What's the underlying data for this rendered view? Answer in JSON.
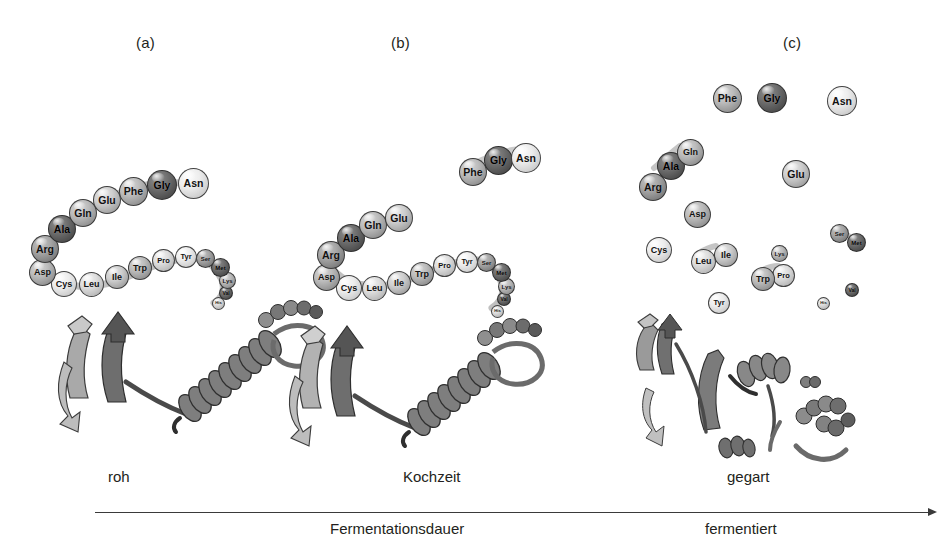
{
  "figure": {
    "type": "scientific-diagram",
    "background_color": "#ffffff"
  },
  "panels": [
    {
      "id": "a",
      "label": "(a)",
      "x": 143,
      "y": 36,
      "stage_caption": "roh"
    },
    {
      "id": "b",
      "label": "(b)",
      "x": 398,
      "y": 36,
      "stage_caption": "Kochzeit"
    },
    {
      "id": "c",
      "label": "(c)",
      "x": 790,
      "y": 36,
      "stage_caption": "gegart"
    }
  ],
  "axis": {
    "line": {
      "x1": 95,
      "x2": 930,
      "y": 512
    },
    "top_labels": [
      {
        "text": "roh",
        "x": 116,
        "y": 477
      },
      {
        "text": "Kochzeit",
        "x": 438,
        "y": 477
      },
      {
        "text": "gegart",
        "x": 756,
        "y": 477
      }
    ],
    "bottom_labels": [
      {
        "text": "Fermentationsdauer",
        "x": 396,
        "y": 527
      },
      {
        "text": "fermentiert",
        "x": 743,
        "y": 527
      }
    ]
  },
  "amino_acid_sequence": [
    "Asp",
    "Arg",
    "Ala",
    "Gln",
    "Glu",
    "Phe",
    "Gly",
    "Asn",
    "Cys",
    "Leu",
    "Ile",
    "Trp",
    "Pro",
    "Tyr",
    "Ser",
    "Met",
    "Lys",
    "Val",
    "His"
  ],
  "panel_a": {
    "description": "Intact folded protein: continuous polypeptide chain with alpha-helix and beta-sheet",
    "spheres": [
      {
        "label": "Asn",
        "x": 178,
        "y": 168,
        "d": 31,
        "tone": "t1"
      },
      {
        "label": "Gly",
        "x": 147,
        "y": 170,
        "d": 30,
        "tone": "t7"
      },
      {
        "label": "Phe",
        "x": 119,
        "y": 177,
        "d": 29,
        "tone": "t4"
      },
      {
        "label": "Glu",
        "x": 93,
        "y": 186,
        "d": 28,
        "tone": "t3"
      },
      {
        "label": "Gln",
        "x": 69,
        "y": 199,
        "d": 28,
        "tone": "t4"
      },
      {
        "label": "Ala",
        "x": 48,
        "y": 215,
        "d": 28,
        "tone": "t7"
      },
      {
        "label": "Arg",
        "x": 31,
        "y": 235,
        "d": 28,
        "tone": "t5"
      },
      {
        "label": "Asp",
        "x": 29,
        "y": 259,
        "d": 27,
        "tone": "t4"
      },
      {
        "label": "Cys",
        "x": 51,
        "y": 271,
        "d": 26,
        "tone": "t1"
      },
      {
        "label": "Leu",
        "x": 79,
        "y": 272,
        "d": 25,
        "tone": "t2"
      },
      {
        "label": "Ile",
        "x": 105,
        "y": 265,
        "d": 24,
        "tone": "t3"
      },
      {
        "label": "Trp",
        "x": 128,
        "y": 256,
        "d": 24,
        "tone": "t4"
      },
      {
        "label": "Pro",
        "x": 152,
        "y": 249,
        "d": 23,
        "tone": "t2"
      },
      {
        "label": "Tyr",
        "x": 175,
        "y": 246,
        "d": 22,
        "tone": "t1"
      },
      {
        "label": "Ser",
        "x": 196,
        "y": 249,
        "d": 19,
        "tone": "t5"
      },
      {
        "label": "Met",
        "x": 211,
        "y": 258,
        "d": 19,
        "tone": "t7"
      },
      {
        "label": "Lys",
        "x": 219,
        "y": 272,
        "d": 17,
        "tone": "t4"
      },
      {
        "label": "Val",
        "x": 219,
        "y": 286,
        "d": 14,
        "tone": "t7"
      },
      {
        "label": "His",
        "x": 212,
        "y": 297,
        "d": 13,
        "tone": "t2"
      }
    ]
  },
  "panel_b": {
    "description": "Partially denatured: chain begins to break, Phe-Gly-Asn fragment released",
    "spheres_detached": [
      {
        "label": "Asn",
        "x": 511,
        "y": 143,
        "d": 30,
        "tone": "t1"
      },
      {
        "label": "Gly",
        "x": 484,
        "y": 146,
        "d": 29,
        "tone": "t7"
      },
      {
        "label": "Phe",
        "x": 459,
        "y": 158,
        "d": 28,
        "tone": "t4"
      }
    ],
    "spheres_chain": [
      {
        "label": "Glu",
        "x": 385,
        "y": 204,
        "d": 28,
        "tone": "t3"
      },
      {
        "label": "Gln",
        "x": 359,
        "y": 211,
        "d": 28,
        "tone": "t4"
      },
      {
        "label": "Ala",
        "x": 337,
        "y": 224,
        "d": 28,
        "tone": "t7"
      },
      {
        "label": "Arg",
        "x": 317,
        "y": 241,
        "d": 28,
        "tone": "t5"
      },
      {
        "label": "Asp",
        "x": 313,
        "y": 264,
        "d": 27,
        "tone": "t4"
      },
      {
        "label": "Cys",
        "x": 336,
        "y": 275,
        "d": 26,
        "tone": "t1"
      },
      {
        "label": "Leu",
        "x": 362,
        "y": 276,
        "d": 25,
        "tone": "t2"
      },
      {
        "label": "Ile",
        "x": 387,
        "y": 271,
        "d": 24,
        "tone": "t3"
      },
      {
        "label": "Trp",
        "x": 410,
        "y": 262,
        "d": 24,
        "tone": "t4"
      },
      {
        "label": "Pro",
        "x": 433,
        "y": 254,
        "d": 23,
        "tone": "t2"
      },
      {
        "label": "Tyr",
        "x": 456,
        "y": 251,
        "d": 22,
        "tone": "t1"
      },
      {
        "label": "Ser",
        "x": 477,
        "y": 253,
        "d": 19,
        "tone": "t5"
      },
      {
        "label": "Met",
        "x": 492,
        "y": 263,
        "d": 19,
        "tone": "t7"
      },
      {
        "label": "Lys",
        "x": 498,
        "y": 278,
        "d": 17,
        "tone": "t4"
      },
      {
        "label": "Val",
        "x": 497,
        "y": 292,
        "d": 14,
        "tone": "t7"
      },
      {
        "label": "His",
        "x": 491,
        "y": 305,
        "d": 13,
        "tone": "t2"
      }
    ]
  },
  "panel_c": {
    "description": "Fully fermented: peptide bonds hydrolysed, free amino acids dispersed",
    "spheres": [
      {
        "label": "Phe",
        "x": 713,
        "y": 84,
        "d": 29,
        "tone": "t4"
      },
      {
        "label": "Gly",
        "x": 757,
        "y": 83,
        "d": 30,
        "tone": "t7"
      },
      {
        "label": "Asn",
        "x": 827,
        "y": 86,
        "d": 30,
        "tone": "t1"
      },
      {
        "label": "Gln",
        "x": 677,
        "y": 139,
        "d": 27,
        "tone": "t4"
      },
      {
        "label": "Ala",
        "x": 657,
        "y": 152,
        "d": 28,
        "tone": "t7"
      },
      {
        "label": "Arg",
        "x": 639,
        "y": 173,
        "d": 28,
        "tone": "t5"
      },
      {
        "label": "Glu",
        "x": 782,
        "y": 160,
        "d": 28,
        "tone": "t3"
      },
      {
        "label": "Asp",
        "x": 684,
        "y": 201,
        "d": 27,
        "tone": "t4"
      },
      {
        "label": "Cys",
        "x": 646,
        "y": 237,
        "d": 26,
        "tone": "t1"
      },
      {
        "label": "Leu",
        "x": 691,
        "y": 249,
        "d": 25,
        "tone": "t2"
      },
      {
        "label": "Ile",
        "x": 714,
        "y": 243,
        "d": 24,
        "tone": "t3"
      },
      {
        "label": "Ser",
        "x": 830,
        "y": 224,
        "d": 19,
        "tone": "t5"
      },
      {
        "label": "Met",
        "x": 847,
        "y": 233,
        "d": 19,
        "tone": "t7"
      },
      {
        "label": "Lys",
        "x": 771,
        "y": 245,
        "d": 17,
        "tone": "t4"
      },
      {
        "label": "Trp",
        "x": 751,
        "y": 267,
        "d": 24,
        "tone": "t4"
      },
      {
        "label": "Pro",
        "x": 772,
        "y": 264,
        "d": 23,
        "tone": "t2"
      },
      {
        "label": "Tyr",
        "x": 708,
        "y": 292,
        "d": 22,
        "tone": "t1"
      },
      {
        "label": "Val",
        "x": 845,
        "y": 283,
        "d": 14,
        "tone": "t7"
      },
      {
        "label": "His",
        "x": 817,
        "y": 297,
        "d": 13,
        "tone": "t2"
      }
    ]
  }
}
